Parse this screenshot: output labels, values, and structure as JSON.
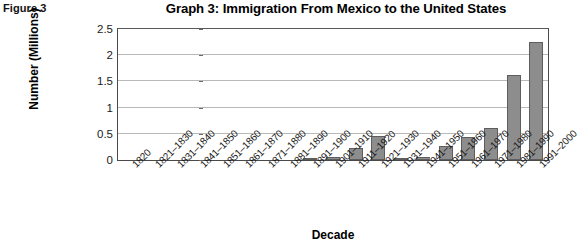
{
  "figure": {
    "caption": "Figure 3"
  },
  "chart_data": {
    "type": "bar",
    "title": "Graph 3: Immigration From Mexico to the United States",
    "xlabel": "Decade",
    "ylabel": "Number (Millions)",
    "ylim": [
      0,
      2.5
    ],
    "yticks": [
      0,
      0.5,
      1,
      1.5,
      2,
      2.5
    ],
    "ytick_labels": [
      "0",
      "0.5",
      "1",
      "1.5",
      "2",
      "2.5"
    ],
    "grid": true,
    "legend": "none",
    "categories": [
      "1820",
      "1821–1830",
      "1831–1840",
      "1841–1850",
      "1851–1860",
      "1861–1870",
      "1871–1880",
      "1881–1890",
      "1891–1900",
      "1901–1910",
      "1911–1920",
      "1921–1930",
      "1931–1940",
      "1941–1950",
      "1951–1960",
      "1961–1970",
      "1971–1980",
      "1981–1990",
      "1991–2000"
    ],
    "values": [
      0,
      0,
      0,
      0,
      0,
      0,
      0,
      0,
      0.01,
      0.05,
      0.22,
      0.46,
      0.02,
      0.06,
      0.27,
      0.44,
      0.62,
      1.63,
      2.25
    ],
    "bar_color": "#8d8d8d",
    "bar_edge_color": "#5e5e5e"
  }
}
